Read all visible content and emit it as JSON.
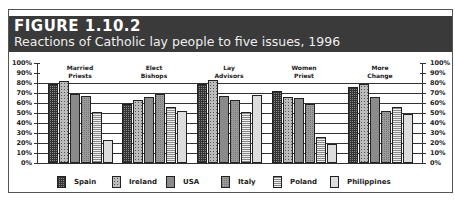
{
  "header": {
    "figure": "FIGURE 1.10.2",
    "title": "Reactions of Catholic lay people to five issues, 1996"
  },
  "yaxis": {
    "ticks": [
      "100%",
      "90%",
      "80%",
      "70%",
      "60%",
      "50%",
      "40%",
      "30%",
      "20%",
      "10%",
      "0%"
    ]
  },
  "groups": [
    {
      "label1": "Married",
      "label2": "Priests"
    },
    {
      "label1": "Elect",
      "label2": "Bishops"
    },
    {
      "label1": "Lay",
      "label2": "Advisors"
    },
    {
      "label1": "Women",
      "label2": "Priest"
    },
    {
      "label1": "More",
      "label2": "Change"
    }
  ],
  "legend": [
    {
      "label": "Spain"
    },
    {
      "label": "Ireland"
    },
    {
      "label": "USA"
    },
    {
      "label": "Italy"
    },
    {
      "label": "Poland"
    },
    {
      "label": "Philippines"
    }
  ],
  "colors": {
    "header_bg": "#3a3a3a",
    "header_text": "#ffffff",
    "axis": "#333333"
  },
  "chart_data": {
    "type": "bar",
    "categories": [
      "Married Priests",
      "Elect Bishops",
      "Lay Advisors",
      "Women Priest",
      "More Change"
    ],
    "series": [
      {
        "name": "Spain",
        "values": [
          79,
          59,
          79,
          72,
          76
        ]
      },
      {
        "name": "Ireland",
        "values": [
          82,
          63,
          83,
          66,
          79
        ]
      },
      {
        "name": "USA",
        "values": [
          69,
          66,
          67,
          65,
          66
        ]
      },
      {
        "name": "Italy",
        "values": [
          67,
          69,
          63,
          59,
          52
        ]
      },
      {
        "name": "Poland",
        "values": [
          51,
          56,
          51,
          26,
          56
        ]
      },
      {
        "name": "Philippines",
        "values": [
          23,
          52,
          68,
          19,
          49
        ]
      }
    ],
    "xlabel": "",
    "ylabel": "",
    "ylim": [
      0,
      100
    ],
    "yticks": [
      "0%",
      "10%",
      "20%",
      "30%",
      "40%",
      "50%",
      "60%",
      "70%",
      "80%",
      "90%",
      "100%"
    ],
    "grid": true,
    "legend_position": "bottom"
  }
}
